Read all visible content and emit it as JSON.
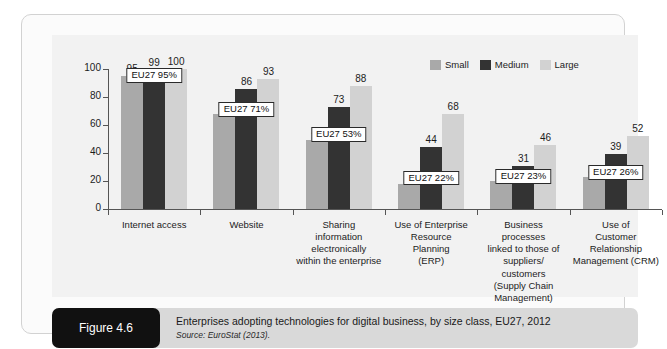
{
  "figure": {
    "tag": "Figure 4.6",
    "caption": "Enterprises adopting technologies for digital business, by size class, EU27, 2012",
    "source": "Source: EuroStat (2013)."
  },
  "colors": {
    "small": "#a9a9a9",
    "medium": "#333333",
    "large": "#d2d2d2",
    "plot_background": "#f2f2f2",
    "caption_background": "#d9d9d9",
    "tag_background": "#111111",
    "axis": "#555555"
  },
  "legend": {
    "position": "top-right",
    "items": [
      {
        "label": "Small",
        "color": "#a9a9a9"
      },
      {
        "label": "Medium",
        "color": "#333333"
      },
      {
        "label": "Large",
        "color": "#d2d2d2"
      }
    ]
  },
  "chart_data": {
    "type": "bar",
    "title": "Enterprises adopting technologies for digital business, by size class, EU27, 2012",
    "xlabel": "",
    "ylabel": "",
    "ylim": [
      0,
      100
    ],
    "yticks": [
      0,
      20,
      40,
      60,
      80,
      100
    ],
    "grid": false,
    "legend_position": "top-right",
    "categories": [
      "Internet access",
      "Website",
      "Sharing information electronically within the enterprise",
      "Use of Enterprise Resource Planning (ERP)",
      "Business processes linked to those of suppliers/ customers (Supply Chain Management)",
      "Use of Customer Relationship Management (CRM)"
    ],
    "category_lines": [
      [
        "Internet access"
      ],
      [
        "Website"
      ],
      [
        "Sharing",
        "information",
        "electronically",
        "within the enterprise"
      ],
      [
        "Use of Enterprise",
        "Resource",
        "Planning",
        "(ERP)"
      ],
      [
        "Business",
        "processes",
        "linked to those of",
        "suppliers/",
        "customers",
        "(Supply Chain",
        "Management)"
      ],
      [
        "Use of",
        "Customer",
        "Relationship",
        "Management (CRM)"
      ]
    ],
    "series": [
      {
        "name": "Small",
        "values": [
          95,
          68,
          49,
          18,
          20,
          23
        ]
      },
      {
        "name": "Medium",
        "values": [
          99,
          86,
          73,
          44,
          31,
          39
        ]
      },
      {
        "name": "Large",
        "values": [
          100,
          93,
          88,
          68,
          46,
          52
        ]
      }
    ],
    "annotations": [
      {
        "category": "Internet access",
        "label": "EU27 95%",
        "value": 95
      },
      {
        "category": "Website",
        "label": "EU27 71%",
        "value": 71
      },
      {
        "category": "Sharing information electronically within the enterprise",
        "label": "EU27 53%",
        "value": 53
      },
      {
        "category": "Use of Enterprise Resource Planning (ERP)",
        "label": "EU27 22%",
        "value": 22
      },
      {
        "category": "Business processes linked to those of suppliers/ customers (Supply Chain Management)",
        "label": "EU27 23%",
        "value": 23
      },
      {
        "category": "Use of Customer Relationship Management (CRM)",
        "label": "EU27 26%",
        "value": 26
      }
    ]
  }
}
